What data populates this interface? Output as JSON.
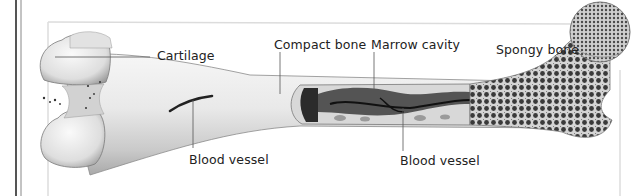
{
  "diagram": {
    "labels": {
      "cartilage": "Cartilage",
      "compact_bone": "Compact bone",
      "marrow_cavity": "Marrow cavity",
      "spongy_bone": "Spongy bone",
      "blood_vessel_left": "Blood vessel",
      "blood_vessel_right": "Blood vessel"
    },
    "colors": {
      "background": "#ffffff",
      "frame": "#d8d8d8",
      "bone_light": "#ececec",
      "bone_shade": "#b8b8b8",
      "marrow_dark": "#2a2a2a",
      "leader_line": "#555555",
      "text": "#222222"
    }
  }
}
